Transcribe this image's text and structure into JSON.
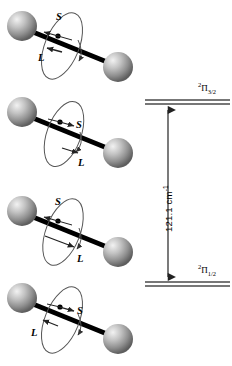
{
  "figure": {
    "kind": "spin-orbit-coupling-diagram",
    "background": "#ffffff",
    "sphere_color": "#9a9a9a",
    "sphere_highlight": "#ededed",
    "sphere_shadow": "#5a5a5a",
    "bond_color": "#000000",
    "orbit_color": "#555555",
    "level_color": "#4a4a4a",
    "arrow_color": "#333333"
  },
  "molecules": [
    {
      "id": "molecule-1",
      "spin_label": "S",
      "orbital_label": "L",
      "spin_arrow_direction": "left",
      "orbital_arrow_direction": "left",
      "orbit_arrow_direction": "down",
      "spin_label_pos": "above",
      "orbital_label_pos": "below-left"
    },
    {
      "id": "molecule-2",
      "spin_label": "S",
      "orbital_label": "L",
      "spin_arrow_direction": "right",
      "orbital_arrow_direction": "right",
      "orbit_arrow_direction": "down",
      "spin_label_pos": "right",
      "orbital_label_pos": "below-right"
    },
    {
      "id": "molecule-3",
      "spin_label": "S",
      "orbital_label": "L",
      "spin_arrow_direction": "left",
      "orbital_arrow_direction": "right",
      "orbit_arrow_direction": "down",
      "spin_label_pos": "above",
      "orbital_label_pos": "below-right"
    },
    {
      "id": "molecule-4",
      "spin_label": "S",
      "orbital_label": "L",
      "spin_arrow_direction": "right",
      "orbital_arrow_direction": "left",
      "orbit_arrow_direction": "down",
      "spin_label_pos": "right",
      "orbital_label_pos": "below-left"
    }
  ],
  "energy_diagram": {
    "upper_level": {
      "multiplicity": "2",
      "term": "Π",
      "j": "3/2",
      "label_plain": "2Π3/2"
    },
    "lower_level": {
      "multiplicity": "2",
      "term": "Π",
      "j": "1/2",
      "label_plain": "2Π1/2"
    },
    "splitting": {
      "value": "121.1",
      "unit": "cm",
      "unit_exponent": "-1",
      "full": "121.1 cm-1"
    }
  }
}
